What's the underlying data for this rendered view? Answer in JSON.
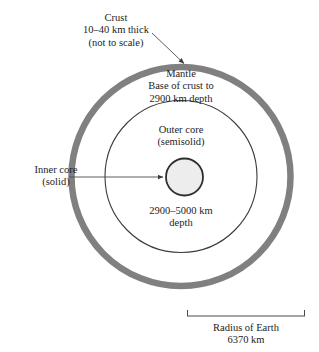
{
  "figure": {
    "background_color": "#ffffff",
    "mantle_ring_color": "#808080",
    "core_outline_color": "#3c3c3c",
    "inner_core_fill": "#ededed",
    "text_color": "#1d1d1d"
  },
  "labels": {
    "crust": "Crust\n10–40 km thick\n(not to scale)",
    "mantle": "Mantle\nBase of crust to\n2900 km depth",
    "outer_core": "Outer core\n(semisolid)",
    "inner_core": "Inner core\n(solid)",
    "outer_core_depth": "2900–5000 km\ndepth",
    "radius": "Radius of Earth\n6370 km"
  },
  "layers": [
    {
      "name": "crust",
      "label": "Crust",
      "thickness": "10–40 km thick",
      "note": "(not to scale)"
    },
    {
      "name": "mantle",
      "label": "Mantle",
      "extent": "Base of crust to 2900 km depth"
    },
    {
      "name": "outer-core",
      "label": "Outer core",
      "state": "(semisolid)",
      "extent": "2900–5000 km depth"
    },
    {
      "name": "inner-core",
      "label": "Inner core",
      "state": "(solid)"
    }
  ],
  "scale": {
    "label": "Radius of Earth",
    "value": "6370 km"
  },
  "icons": {
    "crust_pointer": "arrow-icon",
    "inner_core_pointer": "arrow-icon",
    "radius_bracket": "span-bracket-icon"
  }
}
